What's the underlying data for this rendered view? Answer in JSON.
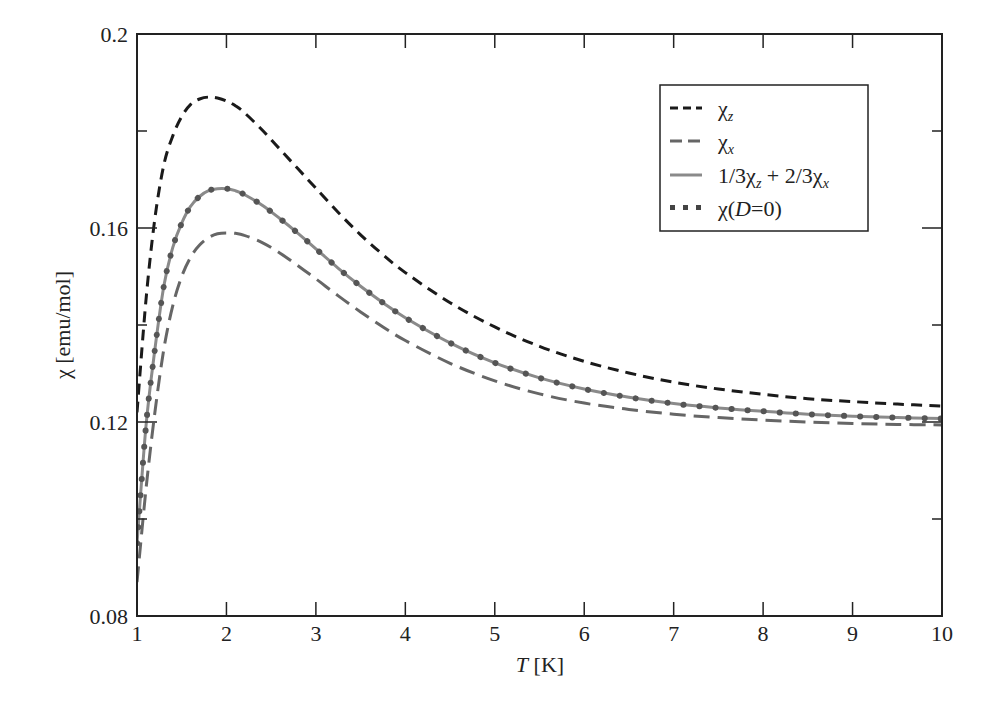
{
  "chart_data": {
    "type": "line",
    "title": "",
    "xlabel": "T [K]",
    "xlabel_italic_part": "T",
    "xlabel_unit": "[K]",
    "ylabel": "χ [emu/mol]",
    "xlim": [
      1,
      10
    ],
    "ylim": [
      0.08,
      0.2
    ],
    "xticks": [
      1,
      2,
      3,
      4,
      5,
      6,
      7,
      8,
      9,
      10
    ],
    "xtick_labels": [
      "1",
      "2",
      "3",
      "4",
      "5",
      "6",
      "7",
      "8",
      "9",
      "10"
    ],
    "yticks": [
      0.08,
      0.12,
      0.16,
      0.2
    ],
    "ytick_labels": [
      "0.08",
      "0.12",
      "0.16",
      "0.2"
    ],
    "yminor_ticks": [
      0.1,
      0.14,
      0.18
    ],
    "grid": false,
    "legend_position": "upper right",
    "x": [
      1.0,
      1.1,
      1.2,
      1.3,
      1.4,
      1.5,
      1.6,
      1.7,
      1.8,
      1.9,
      2.0,
      2.1,
      2.2,
      2.4,
      2.6,
      2.8,
      3.0,
      3.25,
      3.5,
      3.75,
      4.0,
      4.5,
      5.0,
      5.5,
      6.0,
      6.5,
      7.0,
      7.5,
      8.0,
      8.5,
      9.0,
      9.5,
      10.0
    ],
    "series": [
      {
        "name": "χz",
        "label_base": "χ",
        "label_sub": "z",
        "style": "dashed",
        "color": "#1a1a1a",
        "values": [
          0.122,
          0.145,
          0.162,
          0.173,
          0.179,
          0.183,
          0.1855,
          0.1866,
          0.187,
          0.1868,
          0.1862,
          0.1852,
          0.1838,
          0.1802,
          0.1762,
          0.1722,
          0.1682,
          0.1632,
          0.1586,
          0.1545,
          0.1508,
          0.1446,
          0.1396,
          0.1356,
          0.1325,
          0.1301,
          0.1282,
          0.1268,
          0.1257,
          0.1248,
          0.1242,
          0.1237,
          0.1233
        ]
      },
      {
        "name": "χx",
        "label_base": "χ",
        "label_sub": "x",
        "style": "long-dashed",
        "color": "#666666",
        "values": [
          0.087,
          0.106,
          0.122,
          0.135,
          0.144,
          0.15,
          0.154,
          0.1565,
          0.158,
          0.1588,
          0.159,
          0.1589,
          0.1585,
          0.157,
          0.1548,
          0.1522,
          0.1495,
          0.146,
          0.1427,
          0.1396,
          0.1368,
          0.1321,
          0.1285,
          0.1258,
          0.1239,
          0.1226,
          0.1216,
          0.1209,
          0.1204,
          0.12,
          0.1197,
          0.1195,
          0.1194
        ]
      },
      {
        "name": "1/3χz + 2/3χx",
        "label_parts": [
          "1/3χ",
          "z",
          " + 2/3χ",
          "x"
        ],
        "style": "solid",
        "color": "#8a8a8a",
        "values": [
          0.095,
          0.119,
          0.135,
          0.148,
          0.156,
          0.161,
          0.1645,
          0.1665,
          0.1677,
          0.1681,
          0.1681,
          0.1677,
          0.1669,
          0.1647,
          0.1619,
          0.1589,
          0.1557,
          0.1517,
          0.148,
          0.1446,
          0.1415,
          0.1363,
          0.1322,
          0.1291,
          0.1268,
          0.1251,
          0.1238,
          0.1229,
          0.1222,
          0.1216,
          0.1212,
          0.1209,
          0.1207
        ]
      },
      {
        "name": "χ(D=0)",
        "label_parts": [
          "χ(",
          "D",
          "=0)"
        ],
        "style": "dotted",
        "color": "#555555",
        "values": [
          0.095,
          0.119,
          0.135,
          0.148,
          0.156,
          0.161,
          0.1645,
          0.1665,
          0.1677,
          0.1681,
          0.1681,
          0.1677,
          0.1669,
          0.1647,
          0.1619,
          0.1589,
          0.1557,
          0.1517,
          0.148,
          0.1446,
          0.1415,
          0.1363,
          0.1322,
          0.1291,
          0.1268,
          0.1251,
          0.1238,
          0.1229,
          0.1222,
          0.1216,
          0.1212,
          0.1209,
          0.1207
        ]
      }
    ]
  },
  "axes": {
    "x_label_italic": "T",
    "x_label_unit": " [K]",
    "y_label": "χ [emu/mol]"
  },
  "legend": {
    "items": [
      {
        "base": "χ",
        "sub": "z"
      },
      {
        "base": "χ",
        "sub": "x"
      },
      {
        "a": "1/3χ",
        "a_sub": "z",
        "b": " + 2/3χ",
        "b_sub": "x"
      },
      {
        "pre": "χ(",
        "ital": "D",
        "post": "=0)"
      }
    ]
  }
}
